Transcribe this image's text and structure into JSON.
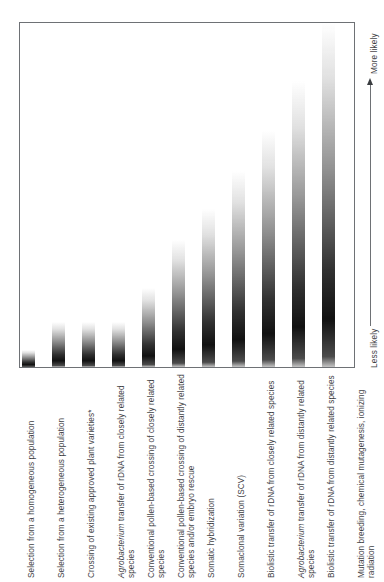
{
  "figure": {
    "name": "likelihood-of-unintended-genetic-effects-chart"
  },
  "axis": {
    "top_label": "More likely",
    "bottom_label": "Less likely",
    "arrow_icon": "up-arrow-icon"
  },
  "chart_data": {
    "type": "bar",
    "title": "",
    "subtitle": "",
    "xlabel": "",
    "ylabel": "",
    "grid": false,
    "legend": null,
    "orientation": "vertical",
    "axis_annotations": {
      "y_top": "More likely",
      "y_bottom": "Less likely"
    },
    "note": "Bars are gradient-filled plumes indicating relative (unquantified) likelihood; height encodes increasing likelihood of unintended genetic effects.",
    "categories": [
      "Selection from a homogeneous population",
      "Selection from a heterogeneous population",
      "Crossing of existing approved plant varieties*",
      "Agrobacterium transfer of rDNA from closely related species",
      "Conventional pollen-based crossing of closely related species",
      "Conventional pollen-based crossing of distantly related species and/or embryo rescue",
      "Somatic hybridization",
      "Somaclonal variation (SCV)",
      "Biolistic transfer of rDNA from closely related species",
      "Agrobacterium transfer of rDNA from distantly related species",
      "Biolistic transfer of rDNA from distantly related species",
      "Mutation breeding, chemical mutagenesis, ionizing radiation"
    ],
    "category_labels_html": [
      "Selection from a homogeneous population",
      "Selection from a heterogeneous population",
      "Crossing of existing approved plant varieties*",
      "<span class=\"ital\">Agrobacterium</span> transfer of rDNA from closely related species",
      "Conventional pollen-based crossing of closely related species",
      "Conventional pollen-based crossing of distantly related species and/or embryo rescue",
      "Somatic hybridization",
      "Somaclonal variation (SCV)",
      "Biolistic transfer of rDNA from closely related species",
      "<span class=\"ital\">Agrobacterium</span> transfer of rDNA from distantly related species",
      "Biolistic transfer of rDNA from distantly related species",
      "Mutation breeding, chemical mutagenesis, ionizing radiation"
    ],
    "values": [
      5,
      13,
      13,
      13,
      23,
      37,
      46,
      57,
      69,
      83,
      92,
      100
    ],
    "ylim": [
      0,
      100
    ],
    "bar_count": 11,
    "bars": [
      {
        "index": 1,
        "center_x": 27,
        "height_pct": 5,
        "label_index": 0
      },
      {
        "index": 2,
        "center_x": 57,
        "height_pct": 13,
        "label_index": 1
      },
      {
        "index": 3,
        "center_x": 87,
        "height_pct": 13,
        "label_index": 2
      },
      {
        "index": 4,
        "center_x": 117,
        "height_pct": 13,
        "label_index": 3
      },
      {
        "index": 5,
        "center_x": 147,
        "height_pct": 23,
        "label_index": 4
      },
      {
        "index": 6,
        "center_x": 177,
        "height_pct": 37,
        "label_index": 5
      },
      {
        "index": 7,
        "center_x": 207,
        "height_pct": 46,
        "label_index": 6
      },
      {
        "index": 8,
        "center_x": 237,
        "height_pct": 57,
        "label_index": 7
      },
      {
        "index": 9,
        "center_x": 267,
        "height_pct": 69,
        "label_index": 8
      },
      {
        "index": 10,
        "center_x": 297,
        "height_pct": 83,
        "label_index": 9
      },
      {
        "index": 11,
        "center_x": 327,
        "height_pct": 100,
        "label_index": 10
      }
    ]
  },
  "colors": {
    "frame": "#6e7175",
    "text": "#3f4246",
    "bar_dark": "#111111",
    "bar_light": "#ffffff",
    "background": "#ffffff"
  }
}
